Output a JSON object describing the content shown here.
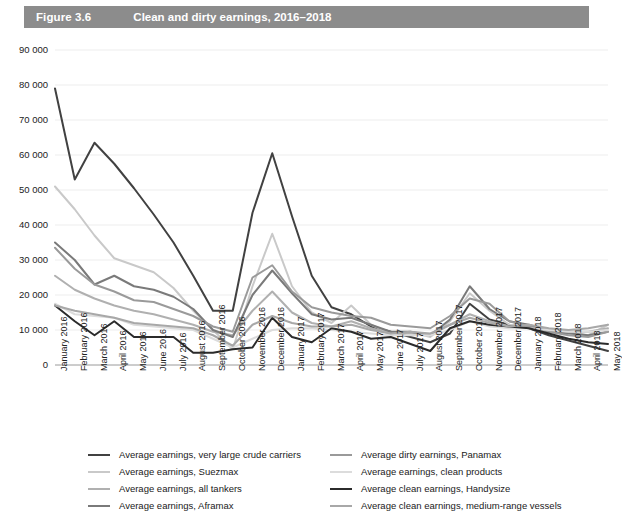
{
  "header": {
    "figure_number": "Figure 3.6",
    "title": "Clean and dirty earnings, 2016–2018",
    "bar_color": "#8c8c8c"
  },
  "chart_data": {
    "type": "line",
    "title": "Clean and dirty earnings, 2016–2018",
    "xlabel": "",
    "ylabel": "",
    "ylim": [
      0,
      90000
    ],
    "ytick_step": 10000,
    "grid": true,
    "legend_position": "bottom",
    "ytick_labels": [
      "90 000",
      "80 000",
      "70 000",
      "60 000",
      "50 000",
      "40 000",
      "30 000",
      "20 000",
      "10 000",
      "0"
    ],
    "ytick_values": [
      90000,
      80000,
      70000,
      60000,
      50000,
      40000,
      30000,
      20000,
      10000,
      0
    ],
    "categories": [
      "January 2016",
      "February 2016",
      "March 2016",
      "April 2016",
      "May 2016",
      "June 2016",
      "July 2016",
      "August 2016",
      "September 2016",
      "October 2016",
      "November 2016",
      "December 2016",
      "January 2017",
      "February 2017",
      "March 2017",
      "April 2017",
      "May 2017",
      "June 2017",
      "July 2017",
      "August 2017",
      "September 2017",
      "October 2017",
      "November 2017",
      "December 2017",
      "January 2018",
      "February 2018",
      "March 2018",
      "April 2018",
      "May 2018"
    ],
    "series": [
      {
        "name": "Average earnings, very large crude carriers",
        "color": "#414141",
        "width": 2.0,
        "values": [
          79000,
          53000,
          63500,
          57500,
          50500,
          43000,
          35000,
          25500,
          15500,
          15500,
          43500,
          60500,
          42500,
          25500,
          16500,
          14500,
          11000,
          9500,
          8000,
          6500,
          9000,
          17500,
          13000,
          11500,
          10500,
          8500,
          7000,
          5500,
          4000
        ]
      },
      {
        "name": "Average earnings, Suezmax",
        "color": "#c9c9c9",
        "width": 2.0,
        "values": [
          51000,
          44500,
          37000,
          30500,
          28500,
          26500,
          22000,
          15500,
          10000,
          4500,
          22500,
          37500,
          22500,
          15000,
          12000,
          17000,
          11500,
          9000,
          9500,
          8000,
          12500,
          20500,
          15500,
          11500,
          11000,
          10000,
          9500,
          8500,
          11500
        ]
      },
      {
        "name": "Average earnings, all tankers",
        "color": "#b0b0b0",
        "width": 2.0,
        "values": [
          25500,
          21500,
          19000,
          17000,
          15500,
          14500,
          13000,
          11500,
          9500,
          8500,
          15500,
          21000,
          15000,
          12000,
          11000,
          12500,
          10500,
          9000,
          9000,
          8500,
          11500,
          14500,
          12500,
          11000,
          11000,
          10000,
          9500,
          9500,
          10500
        ]
      },
      {
        "name": "Average earnings,  Aframax",
        "color": "#7a7a7a",
        "width": 2.0,
        "values": [
          35000,
          30000,
          23000,
          25500,
          22500,
          21500,
          19500,
          16000,
          10000,
          8000,
          20000,
          27000,
          20500,
          14500,
          13000,
          13500,
          11500,
          9500,
          9500,
          8500,
          13000,
          22500,
          16000,
          12500,
          11500,
          9500,
          9000,
          8500,
          9500
        ]
      },
      {
        "name": "Average dirty earnings, Panamax",
        "color": "#9a9a9a",
        "width": 2.0,
        "values": [
          33500,
          27500,
          23000,
          21000,
          18500,
          18000,
          16000,
          14000,
          11000,
          9500,
          25000,
          28500,
          21000,
          16500,
          15000,
          14000,
          13500,
          11500,
          11000,
          10500,
          14000,
          19000,
          17500,
          12500,
          11000,
          9500,
          8500,
          8000,
          9500
        ]
      },
      {
        "name": "Average  earnings, clean products",
        "color": "#dcdcdc",
        "width": 2.0,
        "values": [
          17500,
          14500,
          14000,
          13500,
          11500,
          11000,
          10500,
          10000,
          7500,
          5000,
          7500,
          10000,
          10500,
          10500,
          10000,
          9500,
          9000,
          8500,
          8500,
          8500,
          10000,
          12500,
          11000,
          10500,
          10500,
          10000,
          9500,
          9500,
          10000
        ]
      },
      {
        "name": "Average clean earnings, Handysize",
        "color": "#2b2b2b",
        "width": 2.0,
        "values": [
          17000,
          12500,
          8500,
          12500,
          8000,
          8000,
          8000,
          3500,
          3500,
          4500,
          5000,
          13500,
          8000,
          6500,
          10500,
          9500,
          7500,
          8000,
          6000,
          4000,
          10500,
          12500,
          11500,
          11000,
          10500,
          9000,
          7500,
          6500,
          6000
        ]
      },
      {
        "name": "Average clean earnings, medium-range vessels",
        "color": "#a8a8a8",
        "width": 2.0,
        "values": [
          17000,
          15500,
          14500,
          13500,
          12000,
          11500,
          11000,
          10500,
          8500,
          5500,
          11500,
          14000,
          12000,
          11000,
          11000,
          11500,
          10000,
          9000,
          9500,
          9000,
          11500,
          13500,
          12000,
          11000,
          11500,
          10500,
          10000,
          10500,
          11500
        ]
      }
    ]
  },
  "legend": {
    "left_column": [
      {
        "label": "Average earnings, very large crude carriers",
        "color": "#414141",
        "width": 2.4
      },
      {
        "label": "Average earnings, Suezmax",
        "color": "#c9c9c9",
        "width": 2.0
      },
      {
        "label": "Average earnings, all tankers",
        "color": "#b0b0b0",
        "width": 2.0
      },
      {
        "label": "Average earnings,  Aframax",
        "color": "#7a7a7a",
        "width": 2.0
      }
    ],
    "right_column": [
      {
        "label": "Average dirty earnings, Panamax",
        "color": "#9a9a9a",
        "width": 2.0
      },
      {
        "label": "Average  earnings, clean products",
        "color": "#dcdcdc",
        "width": 2.0
      },
      {
        "label": "Average clean earnings, Handysize",
        "color": "#2b2b2b",
        "width": 2.6
      },
      {
        "label": "Average clean earnings, medium-range vessels",
        "color": "#a8a8a8",
        "width": 2.0
      }
    ]
  }
}
